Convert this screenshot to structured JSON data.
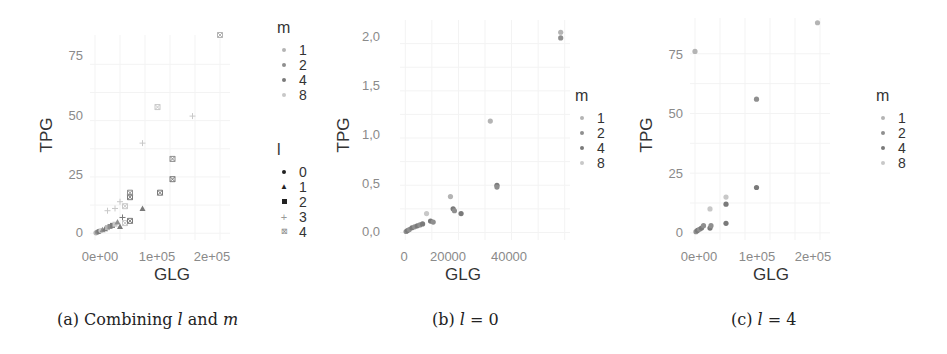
{
  "chart_data": [
    {
      "type": "scatter",
      "panel": "a",
      "caption": "(a) Combining l and m",
      "title": "",
      "xlabel": "GLG",
      "ylabel": "TPG",
      "x_ticks": [
        "0e+00",
        "1e+05",
        "2e+05"
      ],
      "y_ticks": [
        "0",
        "25",
        "50",
        "75"
      ],
      "xlim": [
        -10000,
        270000
      ],
      "ylim": [
        -3,
        88
      ],
      "grid": true,
      "legend_position": "right",
      "legends": [
        {
          "title": "m",
          "entries": [
            "1",
            "2",
            "4",
            "8"
          ]
        },
        {
          "title": "l",
          "entries": [
            "0",
            "1",
            "2",
            "3",
            "4"
          ],
          "shapes": [
            "circle",
            "triangle",
            "square",
            "plus",
            "boxcross"
          ]
        }
      ],
      "points": [
        {
          "x": 2000,
          "y": 0.2,
          "m": "1",
          "l": "0"
        },
        {
          "x": 5000,
          "y": 0.5,
          "m": "2",
          "l": "0"
        },
        {
          "x": 8000,
          "y": 0.8,
          "m": "4",
          "l": "0"
        },
        {
          "x": 12000,
          "y": 1.2,
          "m": "8",
          "l": "0"
        },
        {
          "x": 15000,
          "y": 1.5,
          "m": "2",
          "l": "1"
        },
        {
          "x": 20000,
          "y": 2.0,
          "m": "4",
          "l": "1"
        },
        {
          "x": 25000,
          "y": 2.5,
          "m": "1",
          "l": "2"
        },
        {
          "x": 30000,
          "y": 3.0,
          "m": "2",
          "l": "2"
        },
        {
          "x": 35000,
          "y": 3.5,
          "m": "4",
          "l": "2"
        },
        {
          "x": 40000,
          "y": 4.0,
          "m": "8",
          "l": "2"
        },
        {
          "x": 45000,
          "y": 5.0,
          "m": "2",
          "l": "1"
        },
        {
          "x": 50000,
          "y": 3.0,
          "m": "4",
          "l": "1"
        },
        {
          "x": 55000,
          "y": 7.0,
          "m": "4",
          "l": "3"
        },
        {
          "x": 60000,
          "y": 4.5,
          "m": "8",
          "l": "4"
        },
        {
          "x": 70000,
          "y": 5.5,
          "m": "4",
          "l": "4"
        },
        {
          "x": 25000,
          "y": 10.0,
          "m": "8",
          "l": "3"
        },
        {
          "x": 40000,
          "y": 11.0,
          "m": "8",
          "l": "3"
        },
        {
          "x": 50000,
          "y": 14.0,
          "m": "8",
          "l": "3"
        },
        {
          "x": 60000,
          "y": 12.0,
          "m": "8",
          "l": "4"
        },
        {
          "x": 70000,
          "y": 16.0,
          "m": "4",
          "l": "4"
        },
        {
          "x": 70000,
          "y": 18.0,
          "m": "2",
          "l": "4"
        },
        {
          "x": 95000,
          "y": 11.0,
          "m": "4",
          "l": "1"
        },
        {
          "x": 130000,
          "y": 18.0,
          "m": "4",
          "l": "4"
        },
        {
          "x": 155000,
          "y": 24.0,
          "m": "4",
          "l": "4"
        },
        {
          "x": 155000,
          "y": 33.0,
          "m": "2",
          "l": "4"
        },
        {
          "x": 95000,
          "y": 40.0,
          "m": "8",
          "l": "3"
        },
        {
          "x": 125000,
          "y": 56.0,
          "m": "8",
          "l": "4"
        },
        {
          "x": 195000,
          "y": 52.0,
          "m": "8",
          "l": "3"
        },
        {
          "x": 250000,
          "y": 88.0,
          "m": "1",
          "l": "4"
        }
      ]
    },
    {
      "type": "scatter",
      "panel": "b",
      "caption": "(b) l = 0",
      "title": "",
      "xlabel": "GLG",
      "ylabel": "TPG",
      "x_ticks": [
        "0",
        "20000",
        "40000"
      ],
      "y_ticks": [
        "0,0",
        "0,5",
        "1,0",
        "1,5",
        "2,0"
      ],
      "xlim": [
        -2000,
        62000
      ],
      "ylim": [
        -0.08,
        2.25
      ],
      "grid": true,
      "legend_position": "right",
      "legends": [
        {
          "title": "m",
          "entries": [
            "1",
            "2",
            "4",
            "8"
          ]
        }
      ],
      "points": [
        {
          "x": 300,
          "y": 0.01,
          "m": "2"
        },
        {
          "x": 800,
          "y": 0.02,
          "m": "4"
        },
        {
          "x": 1500,
          "y": 0.03,
          "m": "2"
        },
        {
          "x": 2500,
          "y": 0.05,
          "m": "4"
        },
        {
          "x": 3500,
          "y": 0.06,
          "m": "2"
        },
        {
          "x": 4500,
          "y": 0.07,
          "m": "4"
        },
        {
          "x": 5500,
          "y": 0.08,
          "m": "2"
        },
        {
          "x": 6500,
          "y": 0.09,
          "m": "4"
        },
        {
          "x": 8000,
          "y": 0.2,
          "m": "8"
        },
        {
          "x": 9500,
          "y": 0.12,
          "m": "4"
        },
        {
          "x": 10500,
          "y": 0.11,
          "m": "2"
        },
        {
          "x": 17000,
          "y": 0.38,
          "m": "1"
        },
        {
          "x": 18000,
          "y": 0.25,
          "m": "4"
        },
        {
          "x": 18500,
          "y": 0.23,
          "m": "2"
        },
        {
          "x": 21000,
          "y": 0.2,
          "m": "4"
        },
        {
          "x": 32000,
          "y": 1.18,
          "m": "1"
        },
        {
          "x": 34500,
          "y": 0.5,
          "m": "4"
        },
        {
          "x": 34500,
          "y": 0.48,
          "m": "2"
        },
        {
          "x": 58500,
          "y": 2.12,
          "m": "1"
        },
        {
          "x": 58500,
          "y": 2.06,
          "m": "2"
        }
      ]
    },
    {
      "type": "scatter",
      "panel": "c",
      "caption": "(c) l = 4",
      "title": "",
      "xlabel": "GLG",
      "ylabel": "TPG",
      "x_ticks": [
        "0e+00",
        "1e+05",
        "2e+05"
      ],
      "y_ticks": [
        "0",
        "25",
        "50",
        "75"
      ],
      "xlim": [
        -10000,
        270000
      ],
      "ylim": [
        -3,
        90
      ],
      "grid": true,
      "legend_position": "right",
      "legends": [
        {
          "title": "m",
          "entries": [
            "1",
            "2",
            "4",
            "8"
          ]
        }
      ],
      "points": [
        {
          "x": 2000,
          "y": 0.5,
          "m": "2"
        },
        {
          "x": 5000,
          "y": 1.0,
          "m": "4"
        },
        {
          "x": 9000,
          "y": 1.5,
          "m": "2"
        },
        {
          "x": 13000,
          "y": 2.0,
          "m": "4"
        },
        {
          "x": 17000,
          "y": 3.0,
          "m": "2"
        },
        {
          "x": 30000,
          "y": 2.0,
          "m": "4"
        },
        {
          "x": 32000,
          "y": 3.0,
          "m": "2"
        },
        {
          "x": 30000,
          "y": 10.0,
          "m": "8"
        },
        {
          "x": 62000,
          "y": 4.0,
          "m": "4"
        },
        {
          "x": 62000,
          "y": 12.0,
          "m": "4"
        },
        {
          "x": 62000,
          "y": 15.0,
          "m": "8"
        },
        {
          "x": 123000,
          "y": 19.0,
          "m": "4"
        },
        {
          "x": 123000,
          "y": 56.0,
          "m": "2"
        },
        {
          "x": 245000,
          "y": 88.0,
          "m": "1"
        },
        {
          "x": 0,
          "y": 76.0,
          "m": "1"
        }
      ]
    }
  ],
  "colors": {
    "m1": "#b4b4b4",
    "m2": "#8f8f8f",
    "m4": "#7a7a7a",
    "m8": "#c8c8c8",
    "grid": "#f3f3f3",
    "tick": "#8a8a8a",
    "title": "#333333"
  },
  "captions": {
    "a_prefix": "(a) Combining ",
    "a_l": "l",
    "a_mid": " and ",
    "a_m": "m",
    "b_prefix": "(b) ",
    "b_l": "l",
    "b_rest": " = 0",
    "c_prefix": "(c) ",
    "c_l": "l",
    "c_rest": " = 4"
  }
}
